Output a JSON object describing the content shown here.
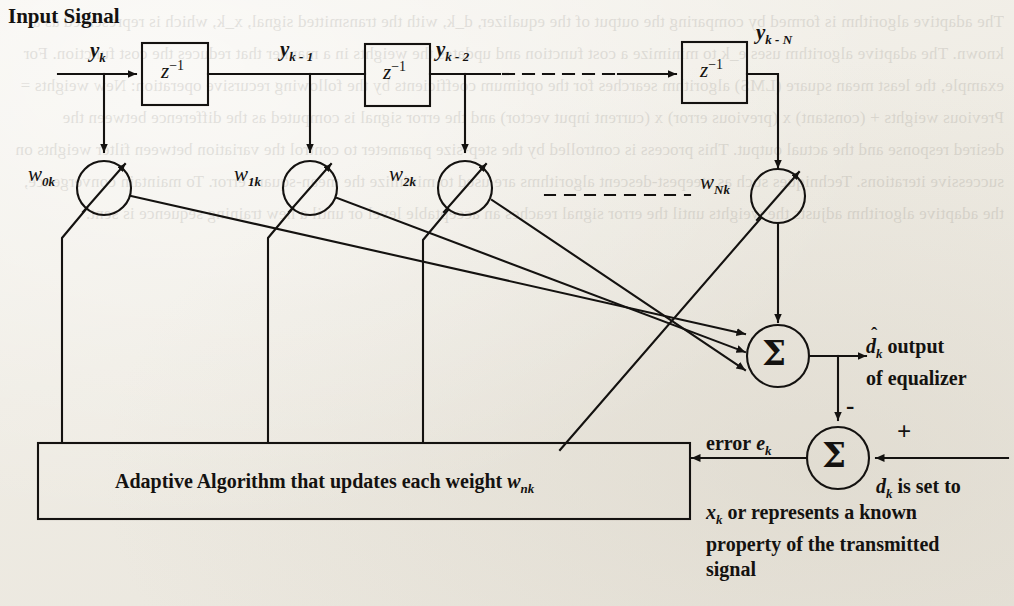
{
  "figure": {
    "kind": "block-diagram",
    "title": "Input Signal",
    "background_color": "#f3f1ec",
    "ink_color": "#141210"
  },
  "signals": {
    "input": "y",
    "input_label": "y_k",
    "taps": [
      {
        "label": "y",
        "sub": "k"
      },
      {
        "label": "y",
        "sub": "k - 1"
      },
      {
        "label": "y",
        "sub": "k - 2"
      },
      {
        "label": "y",
        "sub": "k - N"
      }
    ]
  },
  "delays": {
    "symbol": "z",
    "exponent": "-1",
    "count_shown": 3,
    "elision": "dashed-line"
  },
  "weights": {
    "labels": [
      {
        "base": "w",
        "sub": "0k"
      },
      {
        "base": "w",
        "sub": "1k"
      },
      {
        "base": "w",
        "sub": "2k"
      },
      {
        "base": "w",
        "sub": "Nk"
      }
    ],
    "symbol_note": "circle with diagonal arrow (variable gain / multiplier)"
  },
  "summation": {
    "glyph": "Σ",
    "output_sum_name": "output-summer",
    "error_sum_name": "error-summer"
  },
  "outputs": {
    "estimate_base": "d",
    "estimate_sub": "k",
    "estimate_hat": "ˆ",
    "estimate_text_line1": "output",
    "estimate_text_line2": "of equalizer",
    "error_label_prefix": "error ",
    "error_base": "e",
    "error_sub": "k"
  },
  "signs": {
    "minus": "-",
    "plus": "+"
  },
  "algorithm_box": {
    "text_prefix": "Adaptive Algorithm that updates each weight ",
    "weight_base": "w",
    "weight_sub": "nk"
  },
  "desired_note": {
    "line1_base": "d",
    "line1_sub": "k",
    "line1_rest": " is set to",
    "line2_base": "x",
    "line2_sub": "k",
    "line2_rest": " or represents a known",
    "line3": "property of the transmitted",
    "line4": "signal"
  },
  "bleed_through": "The adaptive algorithm is formed by comparing the output of the equalizer, d_k, with the transmitted signal, x_k, which is represented as a known. The adaptive algorithm uses e_k to minimize a cost function and updates the weights in a manner that reduces the cost function. For example, the least mean square (LMS) algorithm searches for the optimum coefficients by the following recursive operation: New weights = Previous weights + (constant) x (previous error) x (current input vector) and the error signal is computed as the difference between the desired response and the actual output. This process is controlled by the step-size parameter to control the variation between filter weights on successive iterations. Techniques such as steepest-descent algorithms are used to minimize the mean-square error. To maintain convergence, the adaptive algorithm adjusts the weights until the error signal reaches an acceptable level or until a new training sequence is sent."
}
